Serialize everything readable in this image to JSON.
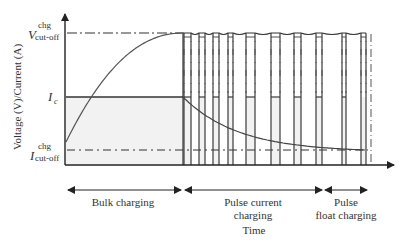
{
  "diagram": {
    "type": "charging-profile",
    "axes": {
      "y_label": "Voltage (V)/Current (A)",
      "x_label": "Time"
    },
    "y_levels": {
      "v_cutoff": {
        "symbol": "V",
        "superscript": "chg",
        "subscript": "cut-off"
      },
      "i_c": {
        "symbol": "I",
        "subscript": "c"
      },
      "i_cutoff": {
        "symbol": "I",
        "superscript": "chg",
        "subscript": "cut-off"
      }
    },
    "phases": [
      {
        "label_lines": [
          "Bulk charging"
        ]
      },
      {
        "label_lines": [
          "Pulse current",
          "charging"
        ]
      },
      {
        "label_lines": [
          "Pulse",
          "float charging"
        ]
      }
    ],
    "pulse_count": 10,
    "colors": {
      "line": "#3a3a3a",
      "curve": "#555555",
      "fill": "#f2f2f2"
    }
  }
}
